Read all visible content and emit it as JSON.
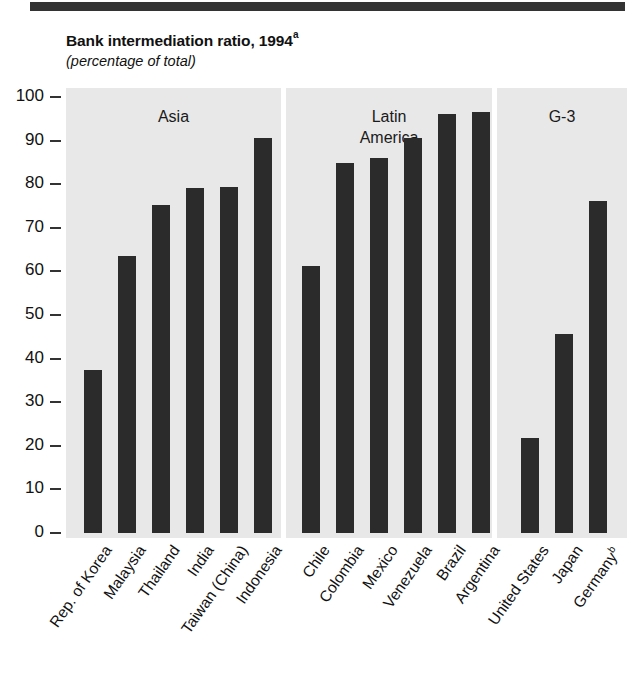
{
  "header": {
    "title": "Bank intermediation ratio, 1994",
    "title_superscript": "a",
    "subtitle": "(percentage of total)"
  },
  "axis": {
    "y_ticks": [
      "100",
      "90",
      "80",
      "70",
      "60",
      "50",
      "40",
      "30",
      "20",
      "10",
      "0"
    ],
    "y_min": 0,
    "y_max": 100
  },
  "panels": [
    {
      "key": "asia",
      "label": "Asia"
    },
    {
      "key": "latam",
      "label": "Latin\nAmerica",
      "line1": "Latin",
      "line2": "America"
    },
    {
      "key": "g3",
      "label": "G-3"
    }
  ],
  "colors": {
    "panel_background": "#e8e8e8",
    "bar": "#2b2b2b",
    "text": "#111111",
    "page_background": "#ffffff",
    "top_rule": "#333333"
  },
  "chart_data": {
    "type": "bar",
    "title": "Bank intermediation ratio, 1994",
    "subtitle": "(percentage of total)",
    "xlabel": "",
    "ylabel": "",
    "ylim": [
      0,
      100
    ],
    "ytick_step": 10,
    "grid": false,
    "legend": "none",
    "note_markers": {
      "title": "a",
      "Germany": "b"
    },
    "groups": [
      {
        "name": "Asia",
        "categories": [
          "Rep. of Korea",
          "Malaysia",
          "Thailand",
          "India",
          "Taiwan (China)",
          "Indonesia"
        ],
        "values": [
          37.5,
          63.5,
          75.2,
          79.2,
          79.4,
          90.5
        ]
      },
      {
        "name": "Latin America",
        "categories": [
          "Chile",
          "Colombia",
          "Mexico",
          "Venezuela",
          "Brazil",
          "Argentina"
        ],
        "values": [
          61.2,
          84.8,
          86.0,
          90.7,
          96.0,
          96.6
        ]
      },
      {
        "name": "G-3",
        "categories": [
          "United States",
          "Japan",
          "Germany"
        ],
        "values": [
          21.8,
          45.6,
          76.2
        ]
      }
    ],
    "categories": [
      "Rep. of Korea",
      "Malaysia",
      "Thailand",
      "India",
      "Taiwan (China)",
      "Indonesia",
      "Chile",
      "Colombia",
      "Mexico",
      "Venezuela",
      "Brazil",
      "Argentina",
      "United States",
      "Japan",
      "Germany"
    ],
    "values": [
      37.5,
      63.5,
      75.2,
      79.2,
      79.4,
      90.5,
      61.2,
      84.8,
      86.0,
      90.7,
      96.0,
      96.6,
      21.8,
      45.6,
      76.2
    ]
  }
}
